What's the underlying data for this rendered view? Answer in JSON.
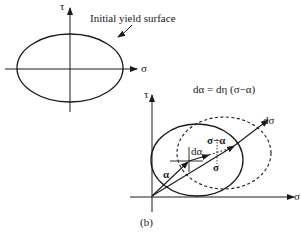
{
  "panel_a": {
    "axis_y_label": "τ",
    "axis_x_label": "σ",
    "callout": "Initial yield surface"
  },
  "panel_b": {
    "axis_y_label": "τ",
    "axis_x_label": "σ",
    "equation": "dα = dη (σ−α)",
    "vec_alpha": "α",
    "vec_dalpha": "dα",
    "vec_sigma_minus_alpha": "σ−α",
    "vec_sigma": "σ",
    "vec_dsigma": "dσ",
    "caption": "(b)"
  },
  "colors": {
    "stroke": "#1a1a1a",
    "background": "#ffffff"
  }
}
